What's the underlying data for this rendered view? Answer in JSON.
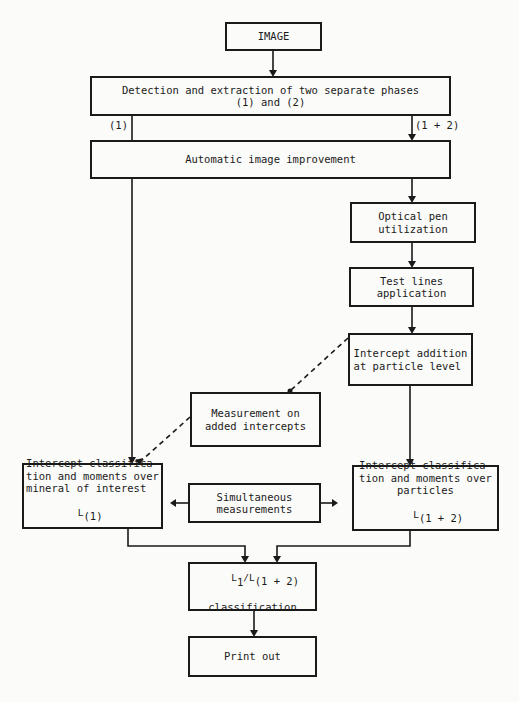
{
  "nodes": {
    "image": "IMAGE",
    "detection_line1": "Detection and extraction of two separate phases",
    "detection_line2": "(1) and (2)",
    "auto_improve": "Automatic image improvement",
    "optical_pen": "Optical pen\nutilization",
    "test_lines": "Test lines\napplication",
    "intercept_addition": "Intercept addition\nat particle level",
    "measurement": "Measurement on\nadded intercepts",
    "left_class": "Intercept classifica-\ntion and moments over\nmineral of interest",
    "left_class_L": "L",
    "left_class_sub": "(1)",
    "simultaneous": "Simultaneous\nmeasurements",
    "right_class": "Intercept classifica-\ntion and moments over\nparticles",
    "right_class_L": "L",
    "right_class_sub": "(1 + 2)",
    "ratio_L1": "L",
    "ratio_1": "1",
    "ratio_slash": "/L",
    "ratio_sub": "(1 + 2)",
    "ratio_text": "classification",
    "print_out": "Print out"
  },
  "edge_labels": {
    "left_branch": "(1)",
    "right_branch": "(1 + 2)"
  }
}
